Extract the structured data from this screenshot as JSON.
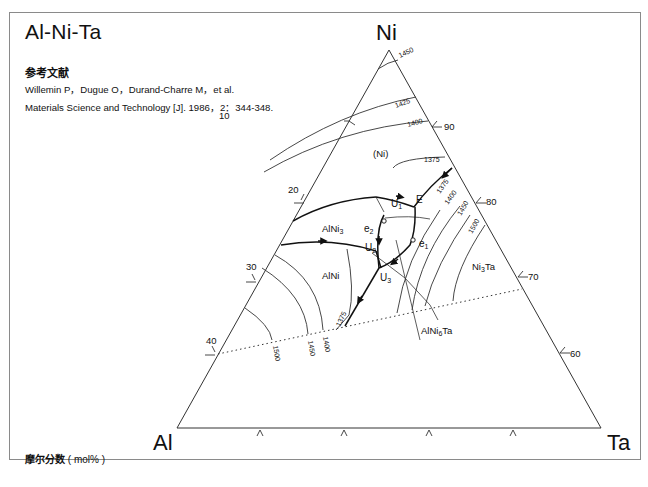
{
  "header": {
    "title": "Al-Ni-Ta",
    "reference_heading": "参考文献",
    "reference_lines": [
      "Willemin P，Dugue O，Durand-Charre M，et al.",
      "Materials Science and Technology [J]. 1986，2：344-348."
    ]
  },
  "footer": {
    "label": "摩尔分数",
    "unit": "( mol% )"
  },
  "diagram": {
    "type": "ternary liquidus projection",
    "corners": {
      "top": "Ni",
      "left": "Al",
      "right": "Ta"
    },
    "left_axis_ticks": [
      "10",
      "20",
      "30",
      "40"
    ],
    "right_axis_ticks": [
      "90",
      "80",
      "70",
      "60"
    ],
    "phase_labels": [
      "(Ni)",
      "AlNi3",
      "AlNi",
      "Ni3Ta",
      "AlNi6Ta"
    ],
    "invariant_points": [
      "U1",
      "U2",
      "U3",
      "E",
      "e1",
      "e2"
    ],
    "isotherms": [
      "1450",
      "1425",
      "1400",
      "1375",
      "1375",
      "1400",
      "1450",
      "1500",
      "1375",
      "1400",
      "1450",
      "1500"
    ]
  }
}
